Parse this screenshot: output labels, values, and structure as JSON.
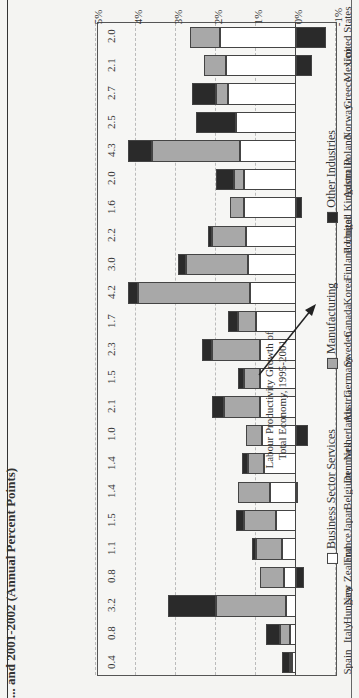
{
  "title": "... and 2001-2002 (Annual Percent Points)",
  "chart_data": {
    "type": "bar",
    "stacked": true,
    "orientation": "vertical (image rotated 90°)",
    "xlabel": "",
    "ylabel": "",
    "ylim": [
      -1,
      5
    ],
    "yticks": [
      "5%",
      "4%",
      "3%",
      "2%",
      "1%",
      "0%",
      "-1%"
    ],
    "grid": true,
    "categories": [
      "Spain",
      "Italy",
      "Hungary",
      "New Zealand",
      "France",
      "Japan",
      "Belgium",
      "Denmark",
      "Netherlands",
      "Austria",
      "Germany",
      "Sweden",
      "Canada",
      "Korea",
      "Finland",
      "Portugal",
      "United Kingdom",
      "Australia",
      "Poland",
      "Norway",
      "Greece",
      "Mexico",
      "United States"
    ],
    "series": [
      {
        "name": "Business Sector Services",
        "color": "#ffffff",
        "values": [
          0.1,
          0.15,
          0.25,
          0.3,
          0.35,
          0.5,
          0.65,
          0.8,
          0.85,
          0.9,
          0.9,
          0.9,
          1.0,
          1.15,
          1.2,
          1.25,
          1.3,
          1.3,
          1.4,
          1.5,
          1.7,
          1.75,
          1.9
        ]
      },
      {
        "name": "Manufacturing",
        "color": "#a8a8a8",
        "values": [
          0.05,
          0.25,
          1.75,
          0.6,
          0.65,
          0.8,
          0.8,
          0.4,
          0.4,
          0.9,
          0.4,
          1.2,
          0.45,
          2.8,
          1.55,
          0.85,
          0.35,
          0.25,
          2.2,
          0.0,
          0.3,
          0.55,
          0.75
        ]
      },
      {
        "name": "Other Industries",
        "color": "#2a2a2a",
        "values": [
          0.2,
          0.35,
          1.2,
          -0.2,
          0.1,
          0.2,
          -0.05,
          0.15,
          -0.3,
          0.3,
          0.15,
          0.25,
          0.25,
          0.25,
          0.2,
          0.1,
          -0.15,
          0.45,
          0.6,
          1.0,
          0.6,
          -0.4,
          -0.75
        ]
      }
    ],
    "totals_label": "Labour Productivity Growth of Total Economy, 1995-2001",
    "totals": [
      0.4,
      0.8,
      3.2,
      0.8,
      1.1,
      1.5,
      1.4,
      1.4,
      1.0,
      2.1,
      1.5,
      2.3,
      1.7,
      4.2,
      3.0,
      2.2,
      1.6,
      2.0,
      4.3,
      2.5,
      2.7,
      2.1,
      2.0
    ],
    "legend": [
      "Business Sector Services",
      "Manufacturing",
      "Other Industries"
    ],
    "legend_position": "bottom"
  }
}
